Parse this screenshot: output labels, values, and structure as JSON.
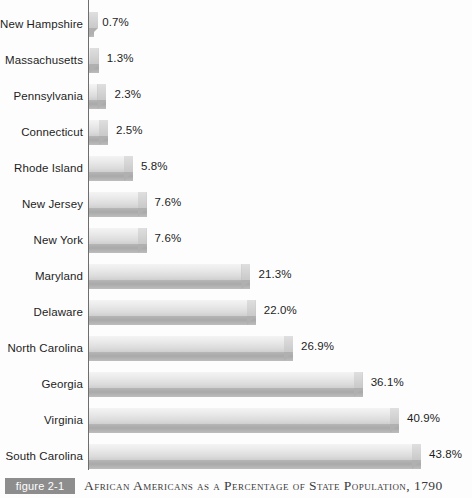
{
  "chart_data": {
    "type": "bar",
    "orientation": "horizontal",
    "title": "African Americans as a Percentage of State Population, 1790",
    "figure_number": "figure 2-1",
    "xlabel": "",
    "ylabel": "",
    "xlim": [
      0,
      43.8
    ],
    "grid": false,
    "legend": "none",
    "value_suffix": "%",
    "categories": [
      "New Hampshire",
      "Massachusetts",
      "Pennsylvania",
      "Connecticut",
      "Rhode Island",
      "New Jersey",
      "New York",
      "Maryland",
      "Delaware",
      "North Carolina",
      "Georgia",
      "Virginia",
      "South Carolina"
    ],
    "values": [
      0.7,
      1.3,
      2.3,
      2.5,
      5.8,
      7.6,
      7.6,
      21.3,
      22.0,
      26.9,
      36.1,
      40.9,
      43.8
    ],
    "value_labels": [
      "0.7%",
      "1.3%",
      "2.3%",
      "2.5%",
      "5.8%",
      "7.6%",
      "7.6%",
      "21.3%",
      "22.0%",
      "26.9%",
      "36.1%",
      "40.9%",
      "43.8%"
    ],
    "bar_style": "3d-gradient-gray",
    "colors": {
      "bar_top": "#eaeaea",
      "bar_base": "#a9a9a9",
      "axis": "#6e6e6e",
      "text": "#1d1d1d",
      "figure_tag_bg": "#8d8d8d",
      "caption_text": "#3b3b3b",
      "background": "#fdfdfd"
    }
  }
}
